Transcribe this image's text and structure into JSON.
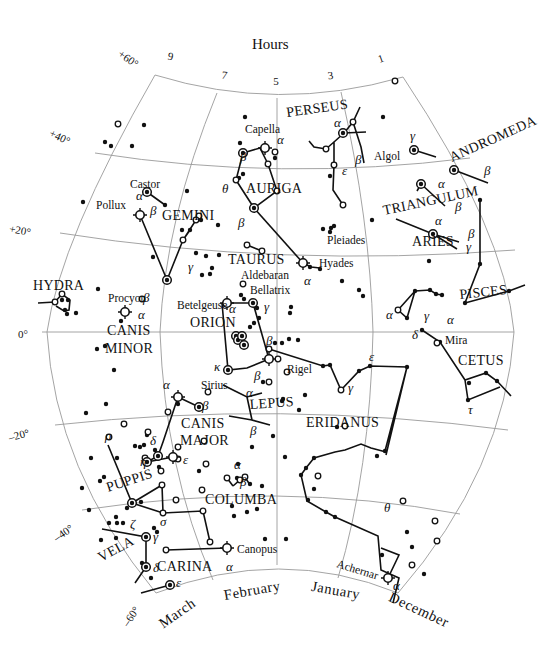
{
  "title": "Hours",
  "hour_ticks": [
    {
      "label": "9",
      "x": 170,
      "y": 60,
      "rot": 10
    },
    {
      "label": "7",
      "x": 224,
      "y": 79,
      "rot": 8
    },
    {
      "label": "5",
      "x": 276,
      "y": 85,
      "rot": 0
    },
    {
      "label": "3",
      "x": 331,
      "y": 79,
      "rot": -8
    },
    {
      "label": "1",
      "x": 382,
      "y": 62,
      "rot": -20
    }
  ],
  "dec_ticks": [
    {
      "label": "+60°",
      "x": 135,
      "y": 68,
      "rot": 35
    },
    {
      "label": "+40°",
      "x": 68,
      "y": 145,
      "rot": 25
    },
    {
      "label": "+20°",
      "x": 30,
      "y": 236,
      "rot": 10
    },
    {
      "label": "0°",
      "x": 28,
      "y": 338,
      "rot": 0
    },
    {
      "label": "–20°",
      "x": 30,
      "y": 436,
      "rot": -15
    },
    {
      "label": "–40°",
      "x": 74,
      "y": 530,
      "rot": -35
    },
    {
      "label": "–60°",
      "x": 140,
      "y": 610,
      "rot": -55
    }
  ],
  "months": [
    {
      "label": "March",
      "x": 180,
      "y": 617,
      "rot": -35
    },
    {
      "label": "February",
      "x": 253,
      "y": 595,
      "rot": -10
    },
    {
      "label": "January",
      "x": 335,
      "y": 595,
      "rot": 10
    },
    {
      "label": "December",
      "x": 417,
      "y": 614,
      "rot": 25
    }
  ],
  "constellations": [
    {
      "name": "PERSEUS",
      "x": 287,
      "y": 117,
      "rot": -8
    },
    {
      "name": "ANDROMEDA",
      "x": 452,
      "y": 162,
      "rot": -24
    },
    {
      "name": "AURIGA",
      "x": 246,
      "y": 193,
      "rot": 0
    },
    {
      "name": "TRIANGULUM",
      "x": 384,
      "y": 215,
      "rot": -12
    },
    {
      "name": "GEMINI",
      "x": 162,
      "y": 220,
      "rot": 0
    },
    {
      "name": "ARIES",
      "x": 412,
      "y": 246,
      "rot": 0
    },
    {
      "name": "TAURUS",
      "x": 228,
      "y": 264,
      "rot": 0
    },
    {
      "name": "HYDRA",
      "x": 33,
      "y": 290,
      "rot": 0
    },
    {
      "name": "PISCES",
      "x": 460,
      "y": 299,
      "rot": -6
    },
    {
      "name": "ORION",
      "x": 190,
      "y": 327,
      "rot": 0
    },
    {
      "name": "CANIS",
      "x": 107,
      "y": 335,
      "rot": 0
    },
    {
      "name": "MINOR",
      "x": 105,
      "y": 353,
      "rot": 0
    },
    {
      "name": "CETUS",
      "x": 458,
      "y": 365,
      "rot": 0
    },
    {
      "name": "LEPUS",
      "x": 250,
      "y": 409,
      "rot": -4
    },
    {
      "name": "CANIS",
      "x": 181,
      "y": 428,
      "rot": 0
    },
    {
      "name": "ERIDANUS",
      "x": 306,
      "y": 427,
      "rot": 0
    },
    {
      "name": "MAJOR",
      "x": 180,
      "y": 445,
      "rot": 0
    },
    {
      "name": "PUPPIS",
      "x": 108,
      "y": 492,
      "rot": -18
    },
    {
      "name": "COLUMBA",
      "x": 205,
      "y": 504,
      "rot": 0
    },
    {
      "name": "VELA",
      "x": 101,
      "y": 562,
      "rot": -28
    },
    {
      "name": "CARINA",
      "x": 157,
      "y": 571,
      "rot": 0
    }
  ],
  "star_names": [
    {
      "name": "Capella",
      "x": 245,
      "y": 133
    },
    {
      "name": "Algol",
      "x": 374,
      "y": 160
    },
    {
      "name": "Castor",
      "x": 130,
      "y": 188
    },
    {
      "name": "Pollux",
      "x": 96,
      "y": 209
    },
    {
      "name": "Pleiades",
      "x": 327,
      "y": 244
    },
    {
      "name": "Aldebaran",
      "x": 241,
      "y": 279
    },
    {
      "name": "Hyades",
      "x": 319,
      "y": 267
    },
    {
      "name": "Bellatrix",
      "x": 250,
      "y": 294
    },
    {
      "name": "Procyon",
      "x": 108,
      "y": 302
    },
    {
      "name": "Betelgeuse",
      "x": 177,
      "y": 309
    },
    {
      "name": "Mira",
      "x": 445,
      "y": 344
    },
    {
      "name": "Rigel",
      "x": 287,
      "y": 373
    },
    {
      "name": "Sirius",
      "x": 201,
      "y": 389
    },
    {
      "name": "Canopus",
      "x": 237,
      "y": 553
    },
    {
      "name": "Achernar",
      "x": 336,
      "y": 567,
      "rot": 17
    }
  ],
  "greek_labels": [
    {
      "t": "α",
      "x": 334,
      "y": 127
    },
    {
      "t": "α",
      "x": 277,
      "y": 144
    },
    {
      "t": "γ",
      "x": 410,
      "y": 140
    },
    {
      "t": "β",
      "x": 355,
      "y": 164
    },
    {
      "t": "ε",
      "x": 342,
      "y": 175
    },
    {
      "t": "β",
      "x": 484,
      "y": 175
    },
    {
      "t": "β",
      "x": 240,
      "y": 161
    },
    {
      "t": "θ",
      "x": 222,
      "y": 193
    },
    {
      "t": "α",
      "x": 438,
      "y": 188
    },
    {
      "t": "β",
      "x": 455,
      "y": 211
    },
    {
      "t": "α",
      "x": 136,
      "y": 200
    },
    {
      "t": "β",
      "x": 150,
      "y": 215
    },
    {
      "t": "β",
      "x": 238,
      "y": 227
    },
    {
      "t": "α",
      "x": 435,
      "y": 225
    },
    {
      "t": "β",
      "x": 468,
      "y": 238
    },
    {
      "t": "γ",
      "x": 466,
      "y": 251
    },
    {
      "t": "γ",
      "x": 188,
      "y": 271
    },
    {
      "t": "α",
      "x": 304,
      "y": 285
    },
    {
      "t": "β",
      "x": 143,
      "y": 302
    },
    {
      "t": "α",
      "x": 138,
      "y": 319
    },
    {
      "t": "γ",
      "x": 264,
      "y": 311
    },
    {
      "t": "α",
      "x": 229,
      "y": 313
    },
    {
      "t": "α",
      "x": 386,
      "y": 319
    },
    {
      "t": "γ",
      "x": 424,
      "y": 320
    },
    {
      "t": "α",
      "x": 447,
      "y": 324
    },
    {
      "t": "δ",
      "x": 412,
      "y": 339
    },
    {
      "t": "β",
      "x": 266,
      "y": 345
    },
    {
      "t": "ε",
      "x": 369,
      "y": 361
    },
    {
      "t": "κ",
      "x": 214,
      "y": 371
    },
    {
      "t": "β",
      "x": 254,
      "y": 380
    },
    {
      "t": "γ",
      "x": 348,
      "y": 392
    },
    {
      "t": "α",
      "x": 163,
      "y": 389
    },
    {
      "t": "β",
      "x": 202,
      "y": 410
    },
    {
      "t": "α",
      "x": 246,
      "y": 397
    },
    {
      "t": "τ",
      "x": 468,
      "y": 414
    },
    {
      "t": "β",
      "x": 250,
      "y": 435
    },
    {
      "t": "ρ",
      "x": 105,
      "y": 440
    },
    {
      "t": "δ",
      "x": 150,
      "y": 445
    },
    {
      "t": "η",
      "x": 140,
      "y": 466
    },
    {
      "t": "ε",
      "x": 183,
      "y": 464
    },
    {
      "t": "α",
      "x": 234,
      "y": 469
    },
    {
      "t": "β",
      "x": 240,
      "y": 486
    },
    {
      "t": "ζ",
      "x": 130,
      "y": 528
    },
    {
      "t": "σ",
      "x": 160,
      "y": 526
    },
    {
      "t": "θ",
      "x": 384,
      "y": 512
    },
    {
      "t": "γ",
      "x": 153,
      "y": 541
    },
    {
      "t": "δ",
      "x": 153,
      "y": 572
    },
    {
      "t": "α",
      "x": 226,
      "y": 571
    },
    {
      "t": "ε",
      "x": 176,
      "y": 587
    },
    {
      "t": "α",
      "x": 393,
      "y": 590
    }
  ],
  "colors": {
    "ink": "#111111",
    "grid": "#9a9a9a",
    "background": "#ffffff"
  }
}
